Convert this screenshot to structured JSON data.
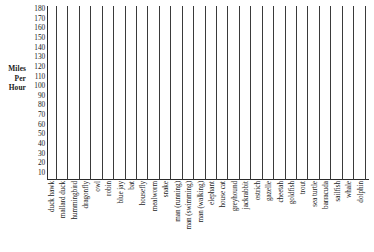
{
  "chart_data": {
    "type": "bar",
    "title": "",
    "subtitle": "",
    "xlabel": "",
    "ylabel": "Miles Per Hour",
    "ylabel_lines": [
      "Miles",
      "Per",
      "Hour"
    ],
    "ylim": [
      0,
      185
    ],
    "yticks": [
      180,
      170,
      160,
      150,
      140,
      130,
      120,
      110,
      100,
      90,
      80,
      70,
      60,
      50,
      40,
      30,
      20,
      10
    ],
    "ytick_labels": [
      "180",
      "170",
      "160",
      "150",
      "140",
      "130",
      "120",
      "110",
      "100",
      "90",
      "80",
      "70",
      "60",
      "50",
      "40",
      "30",
      "20",
      "10"
    ],
    "grid": false,
    "legend": false,
    "legend_position": "none",
    "note": "Blank worksheet chart: category columns are empty, no bars drawn.",
    "categories": [
      "duck hawk",
      "mallard duck",
      "hummingbird",
      "dragonfly",
      "owl",
      "robin",
      "blue jay",
      "bat",
      "housefly",
      "mealworm",
      "snake",
      "man (running)",
      "man (swimming)",
      "man (walking)",
      "elephant",
      "house cat",
      "greyhound",
      "jackrabbit",
      "ostrich",
      "gazelle",
      "cheetah",
      "goldfish",
      "trout",
      "sea turtle",
      "barracuda",
      "sailfish",
      "whale",
      "dolphin"
    ],
    "values": [
      null,
      null,
      null,
      null,
      null,
      null,
      null,
      null,
      null,
      null,
      null,
      null,
      null,
      null,
      null,
      null,
      null,
      null,
      null,
      null,
      null,
      null,
      null,
      null,
      null,
      null,
      null,
      null
    ]
  },
  "style": {
    "axis_color": "#2b2b2b",
    "line_color": "#3a3a3a",
    "text_color": "#1a1a1a",
    "background": "#ffffff"
  }
}
